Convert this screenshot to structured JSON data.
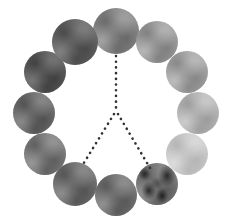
{
  "figure": {
    "title": "",
    "background_color": "#ffffff",
    "width": 236,
    "height": 224
  },
  "chart_data": {
    "type": "scatter",
    "title": "",
    "subtitle": "",
    "xlabel": "",
    "ylabel": "",
    "xlim": [
      0,
      236
    ],
    "ylim": [
      0,
      224
    ],
    "grid": false,
    "legend": null,
    "layout": "circular ring of 12 swatches, center (116, 112), radius 82",
    "categories": [
      "swatch-01",
      "swatch-02",
      "swatch-03",
      "swatch-04",
      "swatch-05",
      "swatch-06",
      "swatch-07",
      "swatch-08",
      "swatch-09",
      "swatch-10",
      "swatch-11",
      "swatch-12"
    ],
    "series": [
      {
        "name": "luminance",
        "values": [
          140,
          161,
          168,
          186,
          206,
          221,
          123,
          118,
          129,
          115,
          96,
          106
        ]
      }
    ],
    "points": [
      {
        "id": "swatch-01",
        "label": "top",
        "angle_deg": 90,
        "cx": 116,
        "cy": 31,
        "r": 23,
        "color": "#8c8c8c",
        "luminance": 140,
        "texture": "smooth"
      },
      {
        "id": "swatch-02",
        "label": "upper-right",
        "angle_deg": 60,
        "cx": 157,
        "cy": 42,
        "r": 21,
        "color": "#a1a1a1",
        "luminance": 161,
        "texture": "smooth"
      },
      {
        "id": "swatch-03",
        "label": "right-upper",
        "angle_deg": 30,
        "cx": 187,
        "cy": 72,
        "r": 21,
        "color": "#a8a8a8",
        "luminance": 168,
        "texture": "smooth"
      },
      {
        "id": "swatch-04",
        "label": "right",
        "angle_deg": 0,
        "cx": 198,
        "cy": 113,
        "r": 21,
        "color": "#bababa",
        "luminance": 186,
        "texture": "smooth"
      },
      {
        "id": "swatch-05",
        "label": "right-lower",
        "angle_deg": -30,
        "cx": 187,
        "cy": 154,
        "r": 21,
        "color": "#cecece",
        "luminance": 206,
        "texture": "smooth"
      },
      {
        "id": "swatch-06",
        "label": "lower-right",
        "angle_deg": -60,
        "cx": 157,
        "cy": 184,
        "r": 21,
        "color": "#7d7d7d",
        "luminance": 221,
        "texture": "mottled"
      },
      {
        "id": "swatch-07",
        "label": "bottom",
        "angle_deg": -90,
        "cx": 116,
        "cy": 195,
        "r": 21,
        "color": "#7a7a7a",
        "luminance": 123,
        "texture": "smooth"
      },
      {
        "id": "swatch-08",
        "label": "lower-left",
        "angle_deg": -120,
        "cx": 75,
        "cy": 184,
        "r": 22,
        "color": "#767676",
        "luminance": 118,
        "texture": "smooth"
      },
      {
        "id": "swatch-09",
        "label": "left-lower",
        "angle_deg": -150,
        "cx": 45,
        "cy": 154,
        "r": 21,
        "color": "#818181",
        "luminance": 129,
        "texture": "smooth"
      },
      {
        "id": "swatch-10",
        "label": "left",
        "angle_deg": 180,
        "cx": 34,
        "cy": 113,
        "r": 21,
        "color": "#737373",
        "luminance": 115,
        "texture": "smooth"
      },
      {
        "id": "swatch-11",
        "label": "left-upper",
        "angle_deg": 150,
        "cx": 45,
        "cy": 72,
        "r": 21,
        "color": "#606060",
        "luminance": 96,
        "texture": "smooth"
      },
      {
        "id": "swatch-12",
        "label": "upper-left",
        "angle_deg": 120,
        "cx": 75,
        "cy": 42,
        "r": 23,
        "color": "#6a6a6a",
        "luminance": 106,
        "texture": "smooth"
      }
    ],
    "annotations": [
      {
        "id": "vertical-guide",
        "style": "dotted",
        "color": "#333333",
        "from": {
          "x": 116,
          "y": 56
        },
        "to": {
          "x": 116,
          "y": 112
        }
      },
      {
        "id": "left-ray",
        "style": "dotted",
        "color": "#333333",
        "from": {
          "x": 114,
          "y": 114
        },
        "to": {
          "x": 82,
          "y": 166
        }
      },
      {
        "id": "right-ray",
        "style": "dotted",
        "color": "#333333",
        "from": {
          "x": 118,
          "y": 114
        },
        "to": {
          "x": 150,
          "y": 168
        }
      }
    ]
  }
}
